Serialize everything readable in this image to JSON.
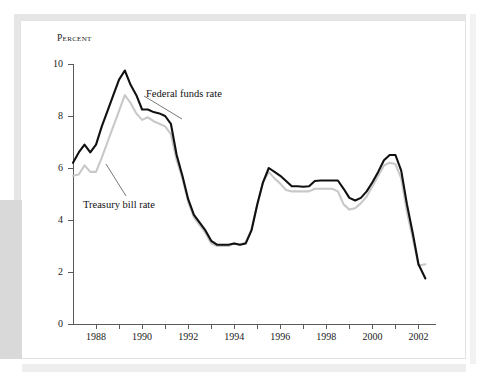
{
  "figure": {
    "ylabel": "Percent",
    "background_color": "#ffffff",
    "frame_color": "#e3e3e3",
    "accent_block_color": "#d9d9d9"
  },
  "chart_data": {
    "type": "line",
    "title": "",
    "xlabel": "",
    "ylabel": "Percent",
    "xlim": [
      1987.0,
      2002.5
    ],
    "ylim": [
      0,
      10
    ],
    "grid": false,
    "legend": "inline-annotations",
    "y_ticks": [
      0,
      2,
      4,
      6,
      8,
      10
    ],
    "y_tick_labels": [
      "0",
      "2",
      "4",
      "6",
      "8",
      "10"
    ],
    "x_ticks_labeled": [
      1988,
      1990,
      1992,
      1994,
      1996,
      1998,
      2000,
      2002
    ],
    "x_tick_labels": [
      "1988",
      "1990",
      "1992",
      "1994",
      "1996",
      "1998",
      "2000",
      "2002"
    ],
    "x_ticks_minor": [
      1989,
      1991,
      1993,
      1995,
      1997,
      1999,
      2001
    ],
    "x": [
      1987.0,
      1987.25,
      1987.5,
      1987.75,
      1988.0,
      1988.25,
      1988.5,
      1988.75,
      1989.0,
      1989.25,
      1989.5,
      1989.75,
      1990.0,
      1990.25,
      1990.5,
      1990.75,
      1991.0,
      1991.25,
      1991.5,
      1991.75,
      1992.0,
      1992.25,
      1992.5,
      1992.75,
      1993.0,
      1993.25,
      1993.5,
      1993.75,
      1994.0,
      1994.25,
      1994.5,
      1994.75,
      1995.0,
      1995.25,
      1995.5,
      1995.75,
      1996.0,
      1996.25,
      1996.5,
      1996.75,
      1997.0,
      1997.25,
      1997.5,
      1997.75,
      1998.0,
      1998.25,
      1998.5,
      1998.75,
      1999.0,
      1999.25,
      1999.5,
      1999.75,
      2000.0,
      2000.25,
      2000.5,
      2000.75,
      2001.0,
      2001.25,
      2001.5,
      2001.75,
      2002.0,
      2002.3
    ],
    "series": [
      {
        "name": "Federal funds rate",
        "color": "#111111",
        "linewidth": 2.1,
        "values": [
          6.2,
          6.6,
          6.9,
          6.6,
          6.9,
          7.6,
          8.2,
          8.8,
          9.4,
          9.75,
          9.2,
          8.8,
          8.25,
          8.25,
          8.15,
          8.1,
          8.0,
          7.7,
          6.5,
          5.7,
          4.8,
          4.2,
          3.9,
          3.6,
          3.2,
          3.05,
          3.05,
          3.05,
          3.1,
          3.05,
          3.1,
          3.6,
          4.6,
          5.45,
          6.0,
          5.85,
          5.7,
          5.5,
          5.3,
          5.3,
          5.28,
          5.3,
          5.5,
          5.52,
          5.52,
          5.52,
          5.52,
          5.2,
          4.85,
          4.75,
          4.85,
          5.1,
          5.45,
          5.85,
          6.3,
          6.5,
          6.5,
          5.9,
          4.6,
          3.5,
          2.3,
          1.75
        ]
      },
      {
        "name": "Treasury bill rate",
        "color": "#c8c8c8",
        "linewidth": 2.1,
        "values": [
          5.7,
          5.75,
          6.1,
          5.85,
          5.85,
          6.4,
          7.0,
          7.6,
          8.2,
          8.8,
          8.5,
          8.1,
          7.85,
          7.95,
          7.8,
          7.7,
          7.6,
          7.3,
          6.3,
          5.6,
          4.7,
          4.1,
          3.8,
          3.5,
          3.1,
          3.0,
          3.0,
          3.0,
          3.1,
          3.05,
          3.15,
          3.65,
          4.6,
          5.45,
          5.85,
          5.6,
          5.4,
          5.15,
          5.1,
          5.1,
          5.1,
          5.1,
          5.2,
          5.2,
          5.2,
          5.2,
          5.1,
          4.6,
          4.4,
          4.45,
          4.65,
          4.9,
          5.3,
          5.7,
          6.1,
          6.2,
          6.15,
          5.6,
          4.3,
          3.3,
          2.25,
          2.3
        ]
      }
    ],
    "annotations": [
      {
        "text": "Federal funds rate",
        "label_x_px": 146,
        "label_y_px": 88,
        "leader_from_px": [
          144,
          96
        ],
        "leader_to_px": [
          182,
          119
        ]
      },
      {
        "text": "Treasury bill rate",
        "label_x_px": 83,
        "label_y_px": 199,
        "leader_from_px": [
          126,
          196
        ],
        "leader_to_px": [
          106,
          164
        ]
      }
    ]
  }
}
